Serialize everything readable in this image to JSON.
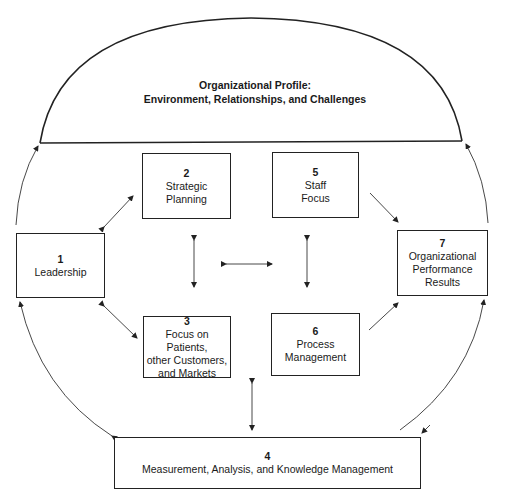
{
  "profile": {
    "line1": "Organizational Profile:",
    "line2": "Environment, Relationships, and Challenges"
  },
  "boxes": [
    {
      "num": "1",
      "lines": [
        "Leadership"
      ]
    },
    {
      "num": "2",
      "lines": [
        "Strategic",
        "Planning"
      ]
    },
    {
      "num": "3",
      "lines": [
        "Focus on Patients,",
        "other Customers,",
        "and Markets"
      ]
    },
    {
      "num": "4",
      "lines": [
        "Measurement, Analysis, and Knowledge Management"
      ]
    },
    {
      "num": "5",
      "lines": [
        "Staff",
        "Focus"
      ]
    },
    {
      "num": "6",
      "lines": [
        "Process",
        "Management"
      ]
    },
    {
      "num": "7",
      "lines": [
        "Organizational",
        "Performance",
        "Results"
      ]
    }
  ],
  "colors": {
    "line": "#222222",
    "background": "#ffffff"
  }
}
